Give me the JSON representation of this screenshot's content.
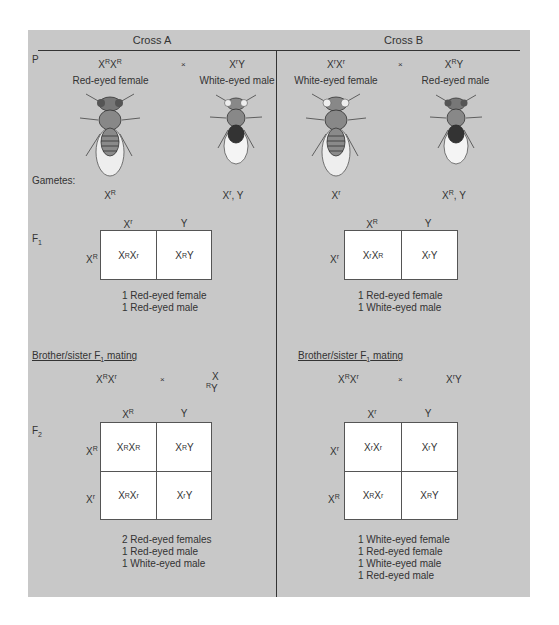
{
  "crossA": {
    "title": "Cross A",
    "p_label": "P",
    "female_genotype": {
      "base1": "X",
      "sup1": "R",
      "base2": "X",
      "sup2": "R"
    },
    "cross_symbol": "×",
    "male_genotype": {
      "base1": "X",
      "sup1": "r",
      "base2": "Y"
    },
    "female_phenotype": "Red-eyed female",
    "male_phenotype": "White-eyed male",
    "gametes_label": "Gametes:",
    "female_gamete": {
      "base": "X",
      "sup": "R"
    },
    "male_gametes": {
      "base": "X",
      "sup": "r",
      "rest": ", Y"
    },
    "f1_label": "F",
    "f1_sub": "1",
    "f1_cols": [
      {
        "base": "X",
        "sup": "r"
      },
      {
        "base": "Y",
        "sup": ""
      }
    ],
    "f1_rows": [
      {
        "base": "X",
        "sup": "R"
      }
    ],
    "f1_cells": [
      [
        "X",
        "R",
        "X",
        "r"
      ],
      [
        "X",
        "R",
        "Y",
        ""
      ]
    ],
    "f1_results": [
      "1 Red-eyed female",
      "1 Red-eyed male"
    ],
    "mating_label": "Brother/sister F",
    "mating_sub": "1",
    "mating_rest": " mating",
    "mating_female": {
      "base1": "X",
      "sup1": "R",
      "base2": "X",
      "sup2": "r"
    },
    "mating_male_top": "X",
    "mating_male_bottom": {
      "sup": "R",
      "base": "Y"
    },
    "f2_label": "F",
    "f2_sub": "2",
    "f2_cols": [
      {
        "base": "X",
        "sup": "R"
      },
      {
        "base": "Y",
        "sup": ""
      }
    ],
    "f2_rows": [
      {
        "base": "X",
        "sup": "R"
      },
      {
        "base": "X",
        "sup": "r"
      }
    ],
    "f2_cells": [
      [
        {
          "a": "X",
          "as": "R",
          "b": "X",
          "bs": "R"
        },
        {
          "a": "X",
          "as": "R",
          "b": "Y",
          "bs": ""
        }
      ],
      [
        {
          "a": "X",
          "as": "R",
          "b": "X",
          "bs": "r"
        },
        {
          "a": "X",
          "as": "r",
          "b": "Y",
          "bs": ""
        }
      ]
    ],
    "f2_results": [
      "2 Red-eyed females",
      "1 Red-eyed male",
      "1 White-eyed male"
    ]
  },
  "crossB": {
    "title": "Cross B",
    "female_genotype": {
      "base1": "X",
      "sup1": "r",
      "base2": "X",
      "sup2": "r"
    },
    "cross_symbol": "×",
    "male_genotype": {
      "base1": "X",
      "sup1": "R",
      "base2": "Y"
    },
    "female_phenotype": "White-eyed female",
    "male_phenotype": "Red-eyed male",
    "female_gamete": {
      "base": "X",
      "sup": "r"
    },
    "male_gametes": {
      "base": "X",
      "sup": "R",
      "rest": ", Y"
    },
    "f1_cols": [
      {
        "base": "X",
        "sup": "R"
      },
      {
        "base": "Y",
        "sup": ""
      }
    ],
    "f1_rows": [
      {
        "base": "X",
        "sup": "r"
      }
    ],
    "f1_cells": [
      [
        "X",
        "r",
        "X",
        "R"
      ],
      [
        "X",
        "r",
        "Y",
        ""
      ]
    ],
    "f1_results": [
      "1 Red-eyed female",
      "1 White-eyed male"
    ],
    "mating_label": "Brother/sister F",
    "mating_sub": "1",
    "mating_rest": " mating",
    "mating_female": {
      "base1": "X",
      "sup1": "R",
      "base2": "X",
      "sup2": "r"
    },
    "mating_male": {
      "base1": "X",
      "sup1": "r",
      "base2": "Y"
    },
    "f2_cols": [
      {
        "base": "X",
        "sup": "r"
      },
      {
        "base": "Y",
        "sup": ""
      }
    ],
    "f2_rows": [
      {
        "base": "X",
        "sup": "r"
      },
      {
        "base": "X",
        "sup": "R"
      }
    ],
    "f2_cells": [
      [
        {
          "a": "X",
          "as": "r",
          "b": "X",
          "bs": "r"
        },
        {
          "a": "X",
          "as": "r",
          "b": "Y",
          "bs": ""
        }
      ],
      [
        {
          "a": "X",
          "as": "R",
          "b": "X",
          "bs": "r"
        },
        {
          "a": "X",
          "as": "R",
          "b": "Y",
          "bs": ""
        }
      ]
    ],
    "f2_results": [
      "1 White-eyed female",
      "1 Red-eyed female",
      "1 White-eyed male",
      "1 Red-eyed male"
    ]
  },
  "colors": {
    "panel_bg": "#c8c8c8",
    "grid_bg": "#ffffff",
    "line": "#333333"
  }
}
